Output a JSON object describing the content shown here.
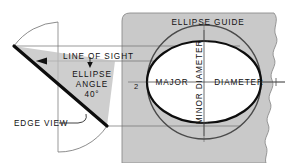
{
  "figure": {
    "background_color": "#ffffff",
    "panel_color": "#c9c9c9",
    "ink_color": "#111111",
    "ellipse_fill": "#ffffff"
  },
  "labels": {
    "ellipse_guide": "ELLIPSE GUIDE",
    "line_of_sight": "LINE OF SIGHT",
    "ellipse_angle_line1": "ELLIPSE",
    "ellipse_angle_line2": "ANGLE",
    "ellipse_angle_value": "40°",
    "edge_view": "EDGE VIEW",
    "major": "MAJOR",
    "diameter": "DIAMETER",
    "minor_diameter": "MINOR DIAMETER",
    "marker_two": "2"
  },
  "geometry": {
    "ellipse_angle_degrees": 40,
    "circle": {
      "cx": 204,
      "cy": 82,
      "r": 57
    },
    "ellipse": {
      "cx": 204,
      "cy": 82,
      "rx": 57,
      "ry": 41
    },
    "apex": {
      "x": 14,
      "y": 46
    },
    "edge_view_end": {
      "x": 107,
      "y": 126
    },
    "panel": {
      "x": 122,
      "y": 13,
      "width": 173,
      "height": 150
    }
  }
}
